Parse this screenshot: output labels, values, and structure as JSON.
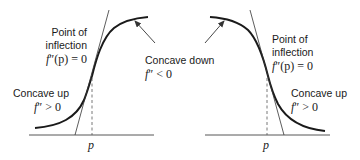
{
  "diagram": {
    "panels": [
      {
        "id": "increasing",
        "inflection_label_line1": "Point of",
        "inflection_label_line2": "inflection",
        "inflection_formula_f": "f",
        "inflection_formula_rest": "″(p) = 0",
        "concave_up_label": "Concave up",
        "concave_up_formula_f": "f",
        "concave_up_formula_rest": "″ > 0",
        "concave_down_label": "Concave down",
        "concave_down_formula_f": "f",
        "concave_down_formula_rest": "″ < 0",
        "axis_tick_label": "p"
      },
      {
        "id": "decreasing",
        "inflection_label_line1": "Point of",
        "inflection_label_line2": "inflection",
        "inflection_formula_f": "f",
        "inflection_formula_rest": "″(p) = 0",
        "concave_up_label": "Concave up",
        "concave_up_formula_f": "f",
        "concave_up_formula_rest": "″ > 0",
        "axis_tick_label": "p"
      }
    ],
    "colors": {
      "curve": "#1a1a1a",
      "line": "#333333"
    }
  }
}
